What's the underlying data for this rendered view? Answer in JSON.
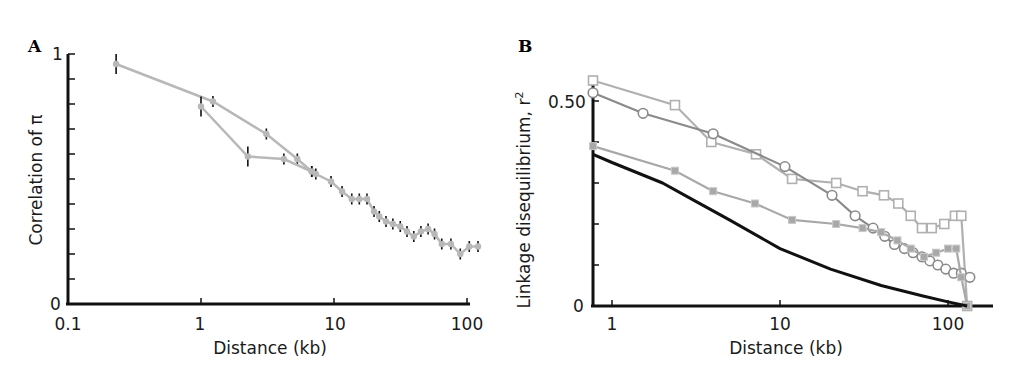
{
  "chart_data": [
    {
      "panel": "A",
      "type": "line",
      "title": "",
      "xlabel": "Distance (kb)",
      "ylabel": "Correlation of π",
      "xscale": "log",
      "xlim": [
        0.1,
        120
      ],
      "ylim": [
        0,
        1
      ],
      "xticks": [
        "0.1",
        "1",
        "10",
        "100"
      ],
      "yticks": [
        "0",
        "1"
      ],
      "grid": false,
      "series": [
        {
          "name": "correlation of pi",
          "marker": "filled-circle-with-error-bars",
          "color": "#b8b8b8",
          "x": [
            0.23,
            1.23,
            3.1,
            5.3,
            6.8,
            7.3,
            9.5,
            11.5,
            13.6,
            15.5,
            17.7,
            20,
            21.9,
            24.6,
            27.7,
            31.5,
            35.4,
            39.8,
            45,
            51,
            57,
            64.6,
            75.7,
            89,
            104,
            121
          ],
          "y": [
            0.96,
            0.81,
            0.68,
            0.58,
            0.53,
            0.52,
            0.49,
            0.45,
            0.42,
            0.42,
            0.42,
            0.37,
            0.35,
            0.33,
            0.32,
            0.31,
            0.29,
            0.27,
            0.29,
            0.3,
            0.28,
            0.24,
            0.24,
            0.2,
            0.23,
            0.23
          ]
        },
        {
          "name": "correlation of pi (branch)",
          "marker": "filled-circle-with-error-bars",
          "color": "#b8b8b8",
          "x": [
            1.0,
            2.25,
            4.2,
            6.8
          ],
          "y": [
            0.79,
            0.59,
            0.58,
            0.53
          ]
        }
      ]
    },
    {
      "panel": "B",
      "type": "line",
      "title": "",
      "xlabel": "Distance (kb)",
      "ylabel": "Linkage disequilibrium, r²",
      "xscale": "log",
      "xlim": [
        0.77,
        200
      ],
      "ylim": [
        0,
        0.55
      ],
      "xticks": [
        "1",
        "10",
        "100"
      ],
      "yticks": [
        "0",
        "0.50"
      ],
      "grid": false,
      "series": [
        {
          "name": "open squares",
          "marker": "open-square",
          "color": "#b0b0b0",
          "x": [
            0.77,
            2.37,
            3.9,
            7.2,
            11.8,
            21.6,
            31,
            41.6,
            50.6,
            60,
            70,
            80,
            95,
            110,
            120,
            130
          ],
          "y": [
            0.55,
            0.49,
            0.4,
            0.37,
            0.31,
            0.3,
            0.28,
            0.27,
            0.25,
            0.22,
            0.19,
            0.19,
            0.2,
            0.22,
            0.22,
            0.0
          ]
        },
        {
          "name": "open circles",
          "marker": "open-circle",
          "color": "#8a8a8a",
          "x": [
            0.77,
            1.53,
            4.0,
            10.7,
            20.4,
            28,
            35.8,
            42,
            48,
            55,
            62,
            70,
            78,
            87,
            97,
            108,
            120,
            135
          ],
          "y": [
            0.52,
            0.47,
            0.42,
            0.34,
            0.27,
            0.22,
            0.19,
            0.17,
            0.15,
            0.14,
            0.13,
            0.12,
            0.11,
            0.1,
            0.09,
            0.08,
            0.08,
            0.07
          ]
        },
        {
          "name": "grey filled squares",
          "marker": "filled-square",
          "color": "#a8a8a8",
          "x": [
            0.77,
            2.37,
            4.0,
            7.1,
            11.8,
            21.6,
            31,
            40,
            50,
            60,
            72,
            85,
            100,
            112,
            120,
            130
          ],
          "y": [
            0.39,
            0.33,
            0.28,
            0.25,
            0.21,
            0.2,
            0.19,
            0.18,
            0.16,
            0.14,
            0.12,
            0.13,
            0.14,
            0.14,
            0.07,
            0.0
          ]
        },
        {
          "name": "expectation curve",
          "marker": "none",
          "color": "#111111",
          "x": [
            0.77,
            1,
            2,
            3,
            5,
            10,
            20,
            40,
            70,
            100,
            130
          ],
          "y": [
            0.37,
            0.35,
            0.3,
            0.26,
            0.21,
            0.14,
            0.09,
            0.05,
            0.025,
            0.01,
            0.0
          ]
        }
      ]
    }
  ],
  "panels": {
    "a": {
      "label": "A",
      "ylabel": "Correlation of π",
      "xlabel": "Distance (kb)",
      "xticks": [
        "0.1",
        "1",
        "10",
        "100"
      ],
      "y_top": "1",
      "y_bottom": "0"
    },
    "b": {
      "label": "B",
      "ylabel": "Linkage disequilibrium, r",
      "ylabel_sup": "2",
      "xlabel": "Distance (kb)",
      "xticks": [
        "1",
        "10",
        "100"
      ],
      "y_top": "0.50",
      "y_bottom": "0"
    }
  }
}
